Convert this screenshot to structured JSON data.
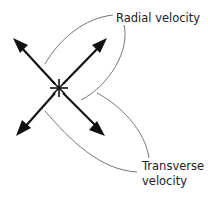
{
  "diagram": {
    "center": {
      "symbol": "star",
      "icon": "asterisk-star-icon"
    },
    "arrows": [
      {
        "name": "arrow-up-left",
        "direction": "up-left",
        "group": "transverse"
      },
      {
        "name": "arrow-up-right",
        "direction": "up-right",
        "group": "radial"
      },
      {
        "name": "arrow-down-left",
        "direction": "down-left",
        "group": "radial"
      },
      {
        "name": "arrow-down-right",
        "direction": "down-right",
        "group": "transverse"
      }
    ],
    "labels": {
      "radial": "Radial velocity",
      "transverse_line1": "Transverse",
      "transverse_line2": "velocity"
    },
    "colors": {
      "arrow": "#111111",
      "leader": "#777777",
      "text": "#222222"
    }
  }
}
